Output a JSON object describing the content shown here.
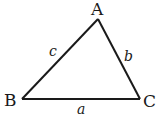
{
  "diagram": {
    "type": "triangle",
    "vertices": [
      {
        "id": "A",
        "label": "A",
        "x": 98,
        "y": 19
      },
      {
        "id": "B",
        "label": "B",
        "x": 22,
        "y": 99
      },
      {
        "id": "C",
        "label": "C",
        "x": 140,
        "y": 99
      }
    ],
    "sides": [
      {
        "id": "a",
        "label": "a",
        "from": "B",
        "to": "C"
      },
      {
        "id": "b",
        "label": "b",
        "from": "A",
        "to": "C"
      },
      {
        "id": "c",
        "label": "c",
        "from": "A",
        "to": "B"
      }
    ],
    "colors": {
      "stroke": "#1a1a1a",
      "background": "#ffffff"
    }
  }
}
